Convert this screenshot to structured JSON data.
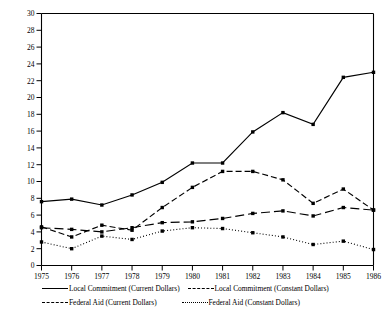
{
  "chart_data": {
    "type": "line",
    "title": "",
    "xlabel": "",
    "ylabel": "Thousands of Dollars",
    "ylim": [
      0,
      30
    ],
    "ytick_step": 2,
    "yticks": [
      "0",
      "2",
      "4",
      "6",
      "8",
      "10",
      "12",
      "14",
      "16",
      "18",
      "20",
      "22",
      "24",
      "26",
      "28",
      "30"
    ],
    "grid": false,
    "legend_position": "below-axes",
    "x": [
      1975,
      1976,
      1977,
      1978,
      1979,
      1980,
      1981,
      1982,
      1983,
      1984,
      1985,
      1986
    ],
    "categories": [
      "1975",
      "1976",
      "1977",
      "1978",
      "1979",
      "1980",
      "1981",
      "1982",
      "1983",
      "1984",
      "1985",
      "1986"
    ],
    "series": [
      {
        "name": "Local Commitment (Current Dollars)",
        "style": "solid",
        "marker": "square",
        "values": [
          7.6,
          7.9,
          7.2,
          8.4,
          9.9,
          12.2,
          12.2,
          15.9,
          18.2,
          16.8,
          22.4,
          23.0
        ]
      },
      {
        "name": "Local Commitment (Constant Dollars)",
        "style": "long-dash",
        "marker": "square",
        "values": [
          4.5,
          4.3,
          4.0,
          4.5,
          5.1,
          5.2,
          5.6,
          6.2,
          6.5,
          5.9,
          6.9,
          6.6
        ]
      },
      {
        "name": "Federal Aid (Current Dollars)",
        "style": "dash",
        "marker": "square",
        "values": [
          4.6,
          3.4,
          4.8,
          4.2,
          6.9,
          9.3,
          11.2,
          11.2,
          10.2,
          7.4,
          9.1,
          6.6
        ]
      },
      {
        "name": "Federal Aid (Constant Dollars)",
        "style": "dot",
        "marker": "square",
        "values": [
          2.8,
          2.0,
          3.5,
          3.1,
          4.1,
          4.5,
          4.4,
          3.9,
          3.4,
          2.5,
          2.9,
          1.9
        ]
      }
    ]
  },
  "legend": {
    "entries": [
      {
        "label": "Local Commitment (Current Dollars)",
        "style": "solid"
      },
      {
        "label": "Local Commitment (Constant Dollars)",
        "style": "long-dash"
      },
      {
        "label": "Federal Aid (Current Dollars)",
        "style": "dash"
      },
      {
        "label": "Federal Aid (Constant Dollars)",
        "style": "dot"
      }
    ]
  },
  "colors": {
    "axis": "#000000",
    "line": "#000000",
    "background": "#ffffff"
  }
}
